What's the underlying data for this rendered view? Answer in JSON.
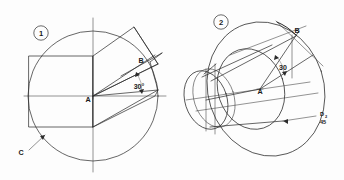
{
  "sheet": {
    "title": "Engineering drawing plate: circle plan view and isometric cylinder",
    "background_color": "#fdfdfd",
    "line_color": "#2b2b2b",
    "width": 344,
    "height": 180
  },
  "figures": [
    {
      "id": "figure-1",
      "balloon_label": "1",
      "balloon_position": {
        "x": 41,
        "y": 33
      },
      "type": "plan-view",
      "description": "Circle with horizontal and vertical centre lines, inscribed rectangle, inclined parallelogram and 30 degree angle from centre A to point B.",
      "circle": {
        "cx": 93,
        "cy": 96,
        "r": 65
      },
      "center_point_label": "A",
      "center_point_label_position": {
        "x": 88,
        "y": 101
      },
      "angle": {
        "value": "30",
        "unit_glyph": "°",
        "label": "30°",
        "position": {
          "x": 139,
          "y": 86
        }
      },
      "point_labels": [
        {
          "text": "B",
          "x": 141,
          "y": 61
        },
        {
          "text": "C",
          "x": 20,
          "y": 153
        }
      ],
      "leader": {
        "label": "C",
        "from": {
          "x": 28,
          "y": 148
        },
        "to": {
          "x": 44,
          "y": 136
        },
        "has_arrowhead": true
      }
    },
    {
      "id": "figure-2",
      "balloon_label": "2",
      "balloon_position": {
        "x": 221,
        "y": 22
      },
      "type": "isometric-pictorial",
      "description": "Isometric cylinder with large rear ellipse, intermediate ellipse and small front ellipse, centre A, point B on upper ellipse, 30 degree angle and leader note D2 45.",
      "center_point_label": "A",
      "center_point_label_position": {
        "x": 260,
        "y": 91
      },
      "angle": {
        "value": "30",
        "unit_glyph": "",
        "label": "30",
        "position": {
          "x": 283,
          "y": 67
        }
      },
      "point_labels": [
        {
          "text": "B",
          "x": 296,
          "y": 34
        }
      ],
      "leader": {
        "label_line_1": "D",
        "label_subscript": "2",
        "label_line_2": "45",
        "from": {
          "x": 318,
          "y": 118
        },
        "to": {
          "x": 283,
          "y": 121
        },
        "has_arrowhead": true
      }
    }
  ],
  "annotations": {
    "angle_symbol": "°",
    "balloon_1": "1",
    "balloon_2": "2",
    "label_a": "A",
    "label_b": "B",
    "label_c": "C",
    "label_d": "D",
    "label_d_subscript": "2",
    "label_45": "45",
    "angle_30_deg": "30°",
    "angle_30": "30"
  }
}
